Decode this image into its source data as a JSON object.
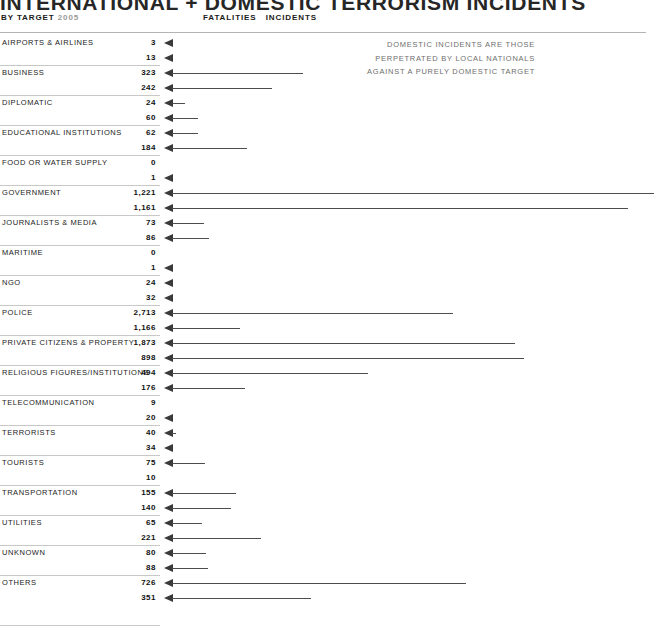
{
  "header": {
    "title": "INTERNATIONAL + DOMESTIC TERRORISM INCIDENTS",
    "subtitle_label": "BY TARGET",
    "subtitle_year": "2005",
    "column_header_fatalities": "FATALITIES",
    "column_header_incidents": "INCIDENTS"
  },
  "note": {
    "line1": "DOMESTIC INCIDENTS ARE THOSE",
    "line2": "PERPETRATED BY LOCAL NATIONALS",
    "line3": "AGAINST A PURELY DOMESTIC TARGET"
  },
  "colors": {
    "rule": "#c8c8c8",
    "top_rule": "#b4b4b4",
    "arrow": "#3a3a3a",
    "shaft": "#4d4d4d",
    "note_text": "#6e6e6e",
    "year_text": "#9a9a9a"
  },
  "chart_data": {
    "type": "bar",
    "title": "INTERNATIONAL + DOMESTIC TERRORISM INCIDENTS",
    "subtitle": "BY TARGET 2005",
    "orientation": "horizontal",
    "xlabel": "",
    "ylabel": "TARGET",
    "grid": false,
    "legend_position": "none",
    "series": [
      {
        "name": "FATALITIES",
        "values": [
          3,
          323,
          24,
          62,
          0,
          1221,
          73,
          0,
          24,
          2713,
          1873,
          494,
          9,
          40,
          75,
          155,
          65,
          80,
          726
        ]
      },
      {
        "name": "INCIDENTS",
        "values": [
          13,
          242,
          60,
          184,
          1,
          1161,
          86,
          1,
          32,
          1166,
          898,
          176,
          20,
          34,
          10,
          140,
          221,
          88,
          351
        ]
      }
    ],
    "categories": [
      "AIRPORTS & AIRLINES",
      "BUSINESS",
      "DIPLOMATIC",
      "EDUCATIONAL INSTITUTIONS",
      "FOOD OR WATER SUPPLY",
      "GOVERNMENT",
      "JOURNALISTS & MEDIA",
      "MARITIME",
      "NGO",
      "POLICE",
      "PRIVATE CITIZENS & PROPERTY",
      "RELIGIOUS FIGURES/INSTITUTIONS",
      "TELECOMMUNICATION",
      "TERRORISTS",
      "TOURISTS",
      "TRANSPORTATION",
      "UTILITIES",
      "UNKNOWN",
      "OTHERS"
    ],
    "rows": [
      {
        "label": "AIRPORTS & AIRLINES",
        "fatalities": "3",
        "incidents": "13",
        "bar_fatalities": 0,
        "bar_incidents": 0
      },
      {
        "label": "BUSINESS",
        "fatalities": "323",
        "incidents": "242",
        "bar_fatalities": 131,
        "bar_incidents": 100
      },
      {
        "label": "DIPLOMATIC",
        "fatalities": "24",
        "incidents": "60",
        "bar_fatalities": 13,
        "bar_incidents": 26
      },
      {
        "label": "EDUCATIONAL INSTITUTIONS",
        "fatalities": "62",
        "incidents": "184",
        "bar_fatalities": 26,
        "bar_incidents": 75
      },
      {
        "label": "FOOD OR WATER SUPPLY",
        "fatalities": "0",
        "incidents": "1",
        "bar_fatalities": -1,
        "bar_incidents": 0
      },
      {
        "label": "GOVERNMENT",
        "fatalities": "1,221",
        "incidents": "1,161",
        "bar_fatalities": 482,
        "bar_incidents": 456
      },
      {
        "label": "JOURNALISTS & MEDIA",
        "fatalities": "73",
        "incidents": "86",
        "bar_fatalities": 32,
        "bar_incidents": 37
      },
      {
        "label": "MARITIME",
        "fatalities": "0",
        "incidents": "1",
        "bar_fatalities": -1,
        "bar_incidents": 0
      },
      {
        "label": "NGO",
        "fatalities": "24",
        "incidents": "32",
        "bar_fatalities": 0,
        "bar_incidents": 0
      },
      {
        "label": "POLICE",
        "fatalities": "2,713",
        "incidents": "1,166",
        "bar_fatalities": 281,
        "bar_incidents": 68
      },
      {
        "label": "PRIVATE CITIZENS & PROPERTY",
        "fatalities": "1,873",
        "incidents": "898",
        "bar_fatalities": 343,
        "bar_incidents": 352
      },
      {
        "label": "RELIGIOUS FIGURES/INSTITUTIONS",
        "fatalities": "494",
        "incidents": "176",
        "bar_fatalities": 196,
        "bar_incidents": 73
      },
      {
        "label": "TELECOMMUNICATION",
        "fatalities": "9",
        "incidents": "20",
        "bar_fatalities": -1,
        "bar_incidents": 0
      },
      {
        "label": "TERRORISTS",
        "fatalities": "40",
        "incidents": "34",
        "bar_fatalities": 4,
        "bar_incidents": 0
      },
      {
        "label": "TOURISTS",
        "fatalities": "75",
        "incidents": "10",
        "bar_fatalities": 33,
        "bar_incidents": -1
      },
      {
        "label": "TRANSPORTATION",
        "fatalities": "155",
        "incidents": "140",
        "bar_fatalities": 64,
        "bar_incidents": 59
      },
      {
        "label": "UTILITIES",
        "fatalities": "65",
        "incidents": "221",
        "bar_fatalities": 30,
        "bar_incidents": 89
      },
      {
        "label": "UNKNOWN",
        "fatalities": "80",
        "incidents": "88",
        "bar_fatalities": 34,
        "bar_incidents": 36
      },
      {
        "label": "OTHERS",
        "fatalities": "726",
        "incidents": "351",
        "bar_fatalities": 294,
        "bar_incidents": 139
      }
    ]
  }
}
